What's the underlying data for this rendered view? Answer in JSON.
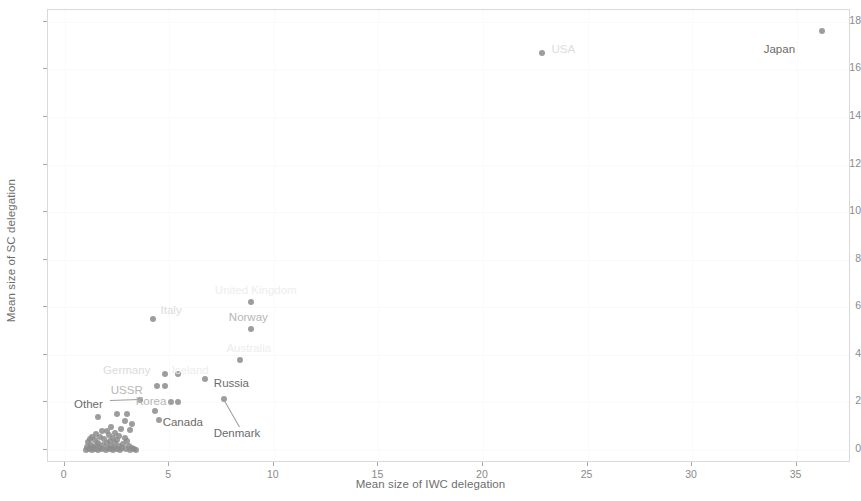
{
  "chart": {
    "type": "scatter",
    "title": "",
    "xlabel": "Mean size of IWC delegation",
    "ylabel": "Mean size of SC delegation",
    "xlim": [
      -0.8,
      37.6
    ],
    "ylim": [
      -0.55,
      18.5
    ],
    "xticks": [
      0,
      5,
      10,
      15,
      20,
      25,
      30,
      35
    ],
    "yticks": [
      0,
      2,
      4,
      6,
      8,
      10,
      12,
      14,
      16,
      18
    ],
    "grid": true,
    "legend": "none",
    "point_color": "#8c8c8c",
    "panel_border_color": "#d9d9d9"
  },
  "chart_data": {
    "type": "scatter",
    "title": "",
    "xlabel": "Mean size of IWC delegation",
    "ylabel": "Mean size of SC delegation",
    "xlim": [
      -0.8,
      37.6
    ],
    "ylim": [
      -0.55,
      18.5
    ],
    "xticks": [
      0,
      5,
      10,
      15,
      20,
      25,
      30,
      35
    ],
    "yticks": [
      0,
      2,
      4,
      6,
      8,
      10,
      12,
      14,
      16,
      18
    ],
    "grid": true,
    "legend_position": "none",
    "series": [
      {
        "name": "Countries",
        "marker": "circle",
        "color": "#8c8c8c",
        "points": [
          {
            "label": "Japan",
            "x": 36.2,
            "y": 17.6
          },
          {
            "label": "USA",
            "x": 22.8,
            "y": 16.7
          },
          {
            "label": "United Kingdom",
            "x": 8.9,
            "y": 6.2
          },
          {
            "label": "Italy",
            "x": 4.2,
            "y": 5.5
          },
          {
            "label": "Norway",
            "x": 8.9,
            "y": 5.1
          },
          {
            "label": "Australia",
            "x": 8.4,
            "y": 3.8
          },
          {
            "label": "Germany",
            "x": 4.8,
            "y": 3.2
          },
          {
            "label": "Iceland",
            "x": 5.4,
            "y": 3.2
          },
          {
            "label": "Russia",
            "x": 6.7,
            "y": 3.0
          },
          {
            "label": "USSR",
            "x": 4.4,
            "y": 2.7
          },
          {
            "label": "USSR2",
            "x": 4.8,
            "y": 2.7
          },
          {
            "label": "Denmark",
            "x": 7.6,
            "y": 2.15
          },
          {
            "label": "Other",
            "x": 3.6,
            "y": 2.1
          },
          {
            "label": "Korea",
            "x": 5.1,
            "y": 2.0
          },
          {
            "label": "Korea2",
            "x": 5.4,
            "y": 2.0
          },
          {
            "label": "Canada",
            "x": 4.3,
            "y": 1.65
          },
          {
            "label": "",
            "x": 2.5,
            "y": 1.5
          },
          {
            "label": "",
            "x": 3.0,
            "y": 1.5
          },
          {
            "label": "",
            "x": 1.6,
            "y": 1.4
          },
          {
            "label": "",
            "x": 4.5,
            "y": 1.25
          },
          {
            "label": "",
            "x": 2.9,
            "y": 1.2
          },
          {
            "label": "",
            "x": 3.2,
            "y": 1.1
          },
          {
            "label": "",
            "x": 2.2,
            "y": 0.95
          },
          {
            "label": "",
            "x": 2.7,
            "y": 0.9
          },
          {
            "label": "",
            "x": 3.1,
            "y": 0.85
          },
          {
            "label": "",
            "x": 1.8,
            "y": 0.8
          },
          {
            "label": "",
            "x": 2.0,
            "y": 0.78
          },
          {
            "label": "",
            "x": 2.4,
            "y": 0.72
          },
          {
            "label": "",
            "x": 1.5,
            "y": 0.65
          },
          {
            "label": "",
            "x": 2.1,
            "y": 0.62
          },
          {
            "label": "",
            "x": 2.6,
            "y": 0.6
          },
          {
            "label": "",
            "x": 1.3,
            "y": 0.55
          },
          {
            "label": "",
            "x": 1.7,
            "y": 0.55
          },
          {
            "label": "",
            "x": 2.3,
            "y": 0.5
          },
          {
            "label": "",
            "x": 2.9,
            "y": 0.5
          },
          {
            "label": "",
            "x": 1.2,
            "y": 0.45
          },
          {
            "label": "",
            "x": 1.9,
            "y": 0.45
          },
          {
            "label": "",
            "x": 2.5,
            "y": 0.42
          },
          {
            "label": "",
            "x": 1.45,
            "y": 0.4
          },
          {
            "label": "",
            "x": 2.15,
            "y": 0.38
          },
          {
            "label": "",
            "x": 3.0,
            "y": 0.38
          },
          {
            "label": "",
            "x": 1.1,
            "y": 0.32
          },
          {
            "label": "",
            "x": 1.6,
            "y": 0.3
          },
          {
            "label": "",
            "x": 2.0,
            "y": 0.3
          },
          {
            "label": "",
            "x": 2.4,
            "y": 0.28
          },
          {
            "label": "",
            "x": 2.8,
            "y": 0.26
          },
          {
            "label": "",
            "x": 1.25,
            "y": 0.22
          },
          {
            "label": "",
            "x": 1.55,
            "y": 0.2
          },
          {
            "label": "",
            "x": 1.85,
            "y": 0.2
          },
          {
            "label": "",
            "x": 2.2,
            "y": 0.18
          },
          {
            "label": "",
            "x": 2.6,
            "y": 0.18
          },
          {
            "label": "",
            "x": 3.05,
            "y": 0.16
          },
          {
            "label": "",
            "x": 1.05,
            "y": 0.12
          },
          {
            "label": "",
            "x": 1.35,
            "y": 0.12
          },
          {
            "label": "",
            "x": 1.7,
            "y": 0.1
          },
          {
            "label": "",
            "x": 2.05,
            "y": 0.1
          },
          {
            "label": "",
            "x": 2.35,
            "y": 0.08
          },
          {
            "label": "",
            "x": 2.75,
            "y": 0.08
          },
          {
            "label": "",
            "x": 3.2,
            "y": 0.08
          },
          {
            "label": "",
            "x": 1.15,
            "y": 0.04
          },
          {
            "label": "",
            "x": 1.45,
            "y": 0.04
          },
          {
            "label": "",
            "x": 1.8,
            "y": 0.03
          },
          {
            "label": "",
            "x": 2.15,
            "y": 0.03
          },
          {
            "label": "",
            "x": 2.5,
            "y": 0.02
          },
          {
            "label": "",
            "x": 2.95,
            "y": 0.02
          },
          {
            "label": "",
            "x": 3.3,
            "y": 0.02
          },
          {
            "label": "",
            "x": 1.0,
            "y": 0.0
          },
          {
            "label": "",
            "x": 1.3,
            "y": 0.0
          },
          {
            "label": "",
            "x": 1.6,
            "y": 0.0
          },
          {
            "label": "",
            "x": 1.95,
            "y": 0.0
          },
          {
            "label": "",
            "x": 2.3,
            "y": 0.0
          },
          {
            "label": "",
            "x": 2.65,
            "y": 0.0
          },
          {
            "label": "",
            "x": 3.1,
            "y": 0.0
          },
          {
            "label": "",
            "x": 3.4,
            "y": 0.0
          }
        ]
      }
    ],
    "annotations": [
      {
        "text": "Japan",
        "x": 36.2,
        "y": 17.6,
        "dx": -58,
        "dy": 18,
        "shade": "dark"
      },
      {
        "text": "USA",
        "x": 22.8,
        "y": 16.7,
        "dx": 10,
        "dy": -4,
        "shade": "faint"
      },
      {
        "text": "United Kingdom",
        "x": 8.9,
        "y": 6.2,
        "dx": -36,
        "dy": -12,
        "shade": "vfaint"
      },
      {
        "text": "Italy",
        "x": 4.2,
        "y": 5.5,
        "dx": 8,
        "dy": -9,
        "shade": "faint"
      },
      {
        "text": "Norway",
        "x": 8.9,
        "y": 5.1,
        "dx": -22,
        "dy": -12,
        "shade": "mid"
      },
      {
        "text": "Australia",
        "x": 8.4,
        "y": 3.8,
        "dx": -14,
        "dy": -12,
        "shade": "vfaint"
      },
      {
        "text": "Germany",
        "x": 4.8,
        "y": 3.2,
        "dx": -62,
        "dy": -4,
        "shade": "faint"
      },
      {
        "text": "Iceland",
        "x": 5.4,
        "y": 3.2,
        "dx": -6,
        "dy": -4,
        "shade": "vfaint"
      },
      {
        "text": "Russia",
        "x": 6.7,
        "y": 3.0,
        "dx": 9,
        "dy": 4,
        "shade": "dark"
      },
      {
        "text": "USSR",
        "x": 4.4,
        "y": 2.7,
        "dx": -46,
        "dy": 4,
        "shade": "mid"
      },
      {
        "text": "Denmark",
        "x": 7.6,
        "y": 2.15,
        "dx": -10,
        "dy": 34,
        "shade": "dark"
      },
      {
        "text": "Other",
        "x": 3.6,
        "y": 2.1,
        "dx": -66,
        "dy": 4,
        "shade": "dark"
      },
      {
        "text": "Korea",
        "x": 5.4,
        "y": 2.0,
        "dx": -42,
        "dy": -1,
        "shade": "mid"
      },
      {
        "text": "Canada",
        "x": 4.3,
        "y": 1.65,
        "dx": 8,
        "dy": 11,
        "shade": "dark"
      }
    ],
    "leaders": [
      {
        "label": "Other",
        "from_x": 3.6,
        "from_y": 2.1,
        "to_dx": -30,
        "to_dy": 1
      },
      {
        "label": "Denmark",
        "from_x": 7.6,
        "from_y": 2.15,
        "to_dx": 16,
        "to_dy": 28
      }
    ]
  }
}
